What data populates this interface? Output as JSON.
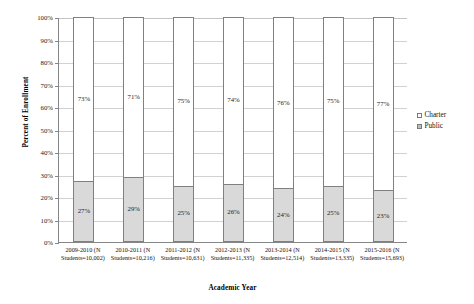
{
  "chart_data": {
    "type": "bar",
    "subtype": "100% stacked column",
    "title": "",
    "xlabel": "Academic Year",
    "ylabel": "Percent of Enrollment",
    "ylim": [
      0,
      100
    ],
    "ytick_labels": [
      "100%",
      "90%",
      "80%",
      "70%",
      "60%",
      "50%",
      "40%",
      "30%",
      "20%",
      "10%",
      "0%"
    ],
    "ytick_values": [
      100,
      90,
      80,
      70,
      60,
      50,
      40,
      30,
      20,
      10,
      0
    ],
    "grid": "horizontal",
    "legend_position": "right",
    "categories": [
      "2009-2010 (N Students=10,002)",
      "2010-2011 (N Students=10,216)",
      "2011-2012 (N Students=10,631)",
      "2012-2013 (N Students=11,335)",
      "2013-2014 (N Students=12,514)",
      "2014-2015 (N Students=13,335)",
      "2015-2016 (N Students=15,693)"
    ],
    "category_lines": [
      {
        "line1": "2009-2010 (N",
        "line2": "Students=10,002)"
      },
      {
        "line1": "2010-2011 (N",
        "line2": "Students=10,216)"
      },
      {
        "line1": "2011-2012 (N",
        "line2": "Students=10,631)"
      },
      {
        "line1": "2012-2013 (N",
        "line2": "Students=11,335)"
      },
      {
        "line1": "2013-2014 (N",
        "line2": "Students=12,514)"
      },
      {
        "line1": "2014-2015 (N",
        "line2": "Students=13,335)"
      },
      {
        "line1": "2015-2016 (N",
        "line2": "Students=15,693)"
      }
    ],
    "series": [
      {
        "name": "Charter",
        "color": "#ffffff",
        "values": [
          73,
          71,
          75,
          74,
          76,
          75,
          77
        ],
        "labels": [
          "73%",
          "71%",
          "75%",
          "74%",
          "76%",
          "75%",
          "77%"
        ]
      },
      {
        "name": "Public",
        "color": "#d9d9d9",
        "values": [
          27,
          29,
          25,
          26,
          24,
          25,
          23
        ],
        "labels": [
          "27%",
          "29%",
          "25%",
          "26%",
          "24%",
          "25%",
          "23%"
        ]
      }
    ]
  },
  "legend": {
    "items": [
      {
        "label": "Charter",
        "swatch": "charter"
      },
      {
        "label": "Public",
        "swatch": "public"
      }
    ]
  }
}
